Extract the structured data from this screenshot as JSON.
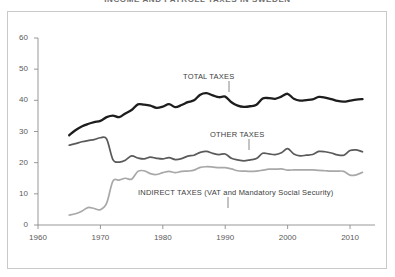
{
  "title": "INCOME AND PAYROLL TAXES IN SWEDEN",
  "colors": {
    "total": "#1d1d1d",
    "other": "#5a5a5a",
    "indirect": "#a8a8a8",
    "axis": "#8c8c8c",
    "frame": "#c9c9c9",
    "text": "#3c3c3c"
  },
  "axes": {
    "y_ticks": [
      "0",
      "10",
      "20",
      "30",
      "40",
      "50",
      "60"
    ],
    "x_ticks": [
      "1960",
      "1970",
      "1980",
      "1990",
      "2000",
      "2010"
    ]
  },
  "annotations": {
    "total": "TOTAL TAXES",
    "other": "OTHER TAXES",
    "indirect": "INDIRECT TAXES (VAT and Mandatory Social Security)"
  },
  "chart_data": {
    "type": "line",
    "title": "INCOME AND PAYROLL TAXES IN SWEDEN",
    "xlabel": "",
    "ylabel": "",
    "xlim": [
      1960,
      2014
    ],
    "ylim": [
      0,
      60
    ],
    "grid": false,
    "legend": "inline-annotations",
    "x": [
      1965,
      1966,
      1967,
      1968,
      1969,
      1970,
      1971,
      1972,
      1973,
      1974,
      1975,
      1976,
      1977,
      1978,
      1979,
      1980,
      1981,
      1982,
      1983,
      1984,
      1985,
      1986,
      1987,
      1988,
      1989,
      1990,
      1991,
      1992,
      1993,
      1994,
      1995,
      1996,
      1997,
      1998,
      1999,
      2000,
      2001,
      2002,
      2003,
      2004,
      2005,
      2006,
      2007,
      2008,
      2009,
      2010,
      2011,
      2012
    ],
    "series": [
      {
        "name": "TOTAL TAXES",
        "color": "#1d1d1d",
        "values": [
          28.8,
          30.4,
          31.6,
          32.4,
          33.0,
          33.4,
          34.6,
          35.1,
          34.6,
          35.8,
          36.9,
          38.7,
          38.6,
          38.3,
          37.6,
          38.0,
          38.8,
          37.8,
          38.5,
          39.4,
          40.0,
          41.8,
          42.3,
          41.6,
          41.0,
          41.2,
          39.4,
          38.3,
          37.9,
          38.1,
          38.6,
          40.6,
          40.7,
          40.5,
          41.2,
          42.1,
          40.5,
          39.9,
          40.1,
          40.3,
          41.1,
          40.9,
          40.4,
          39.8,
          39.6,
          39.9,
          40.2,
          40.4
        ]
      },
      {
        "name": "OTHER TAXES",
        "color": "#5a5a5a",
        "values": [
          25.6,
          26.1,
          26.7,
          27.1,
          27.4,
          28.0,
          27.6,
          21.0,
          20.2,
          20.8,
          22.2,
          21.5,
          21.2,
          21.8,
          21.4,
          21.2,
          21.6,
          21.0,
          21.3,
          22.1,
          22.4,
          23.3,
          23.6,
          23.0,
          22.6,
          22.8,
          21.4,
          20.9,
          20.6,
          20.9,
          21.3,
          23.0,
          22.8,
          22.6,
          23.2,
          24.5,
          22.8,
          22.2,
          22.4,
          22.6,
          23.6,
          23.5,
          23.1,
          22.5,
          22.4,
          23.9,
          24.1,
          23.5
        ]
      },
      {
        "name": "INDIRECT TAXES (VAT and Mandatory Social Security)",
        "color": "#a8a8a8",
        "values": [
          3.2,
          3.6,
          4.4,
          5.6,
          5.3,
          4.9,
          7.0,
          14.1,
          14.4,
          15.0,
          14.7,
          17.2,
          17.4,
          16.5,
          16.2,
          16.8,
          17.2,
          16.8,
          17.2,
          17.3,
          17.6,
          18.5,
          18.7,
          18.6,
          18.4,
          18.4,
          18.0,
          17.4,
          17.3,
          17.2,
          17.3,
          17.6,
          17.9,
          17.9,
          18.0,
          17.6,
          17.7,
          17.7,
          17.7,
          17.7,
          17.5,
          17.4,
          17.3,
          17.3,
          17.2,
          16.0,
          16.1,
          16.9
        ]
      }
    ]
  }
}
